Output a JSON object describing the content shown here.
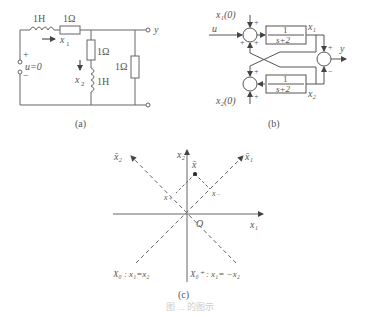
{
  "panel_a": {
    "caption": "(a)",
    "inductor1": "1H",
    "resistor1": "1Ω",
    "resistor2": "1Ω",
    "inductor2": "1H",
    "resistor3": "1Ω",
    "current_x1": "x",
    "current_x1_sub": "1",
    "current_x2": "x",
    "current_x2_sub": "2",
    "source": "u=0",
    "plus": "+",
    "minus": "−",
    "output": "y"
  },
  "panel_b": {
    "caption": "(b)",
    "input": "u",
    "init1": "x₁(0)",
    "init2": "x₂(0)",
    "block_num": "1",
    "block_den": "s+2",
    "out1": "x₁",
    "out2": "x₂",
    "output": "y",
    "plus": "+",
    "minus": "−"
  },
  "panel_c": {
    "caption": "(c)",
    "axis_x1": "x₁",
    "axis_x2": "x₂",
    "axis_x1_bar": "x̄₁",
    "axis_x2_bar": "x̄₂",
    "point": "x̄",
    "proj_minus": "x₋",
    "proj_plus": "x₊",
    "origin": "O",
    "subspace_left": "X₀ : x₁=x₂",
    "subspace_right": "X₀⁺ : x₁= −x₂"
  },
  "figure_caption": "图 ... 的图示"
}
